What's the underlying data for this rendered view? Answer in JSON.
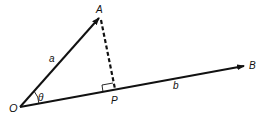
{
  "diagram": {
    "points": {
      "O": {
        "label": "O",
        "x": 20,
        "y": 107
      },
      "A": {
        "label": "A",
        "x": 100,
        "y": 17
      },
      "P": {
        "label": "P",
        "x": 115,
        "y": 90
      },
      "B": {
        "label": "B",
        "x": 245,
        "y": 66
      }
    },
    "vectors": {
      "a": {
        "label": "a",
        "from": "O",
        "to": "A"
      },
      "b": {
        "label": "b",
        "from": "O",
        "to": "B"
      }
    },
    "perpendicular": {
      "from": "A",
      "to": "P",
      "style": "dashed"
    },
    "angle": {
      "label": "θ",
      "between": [
        "a",
        "b"
      ],
      "at": "O"
    },
    "right_angle_marker_at": "P",
    "line_color": "#111111"
  }
}
